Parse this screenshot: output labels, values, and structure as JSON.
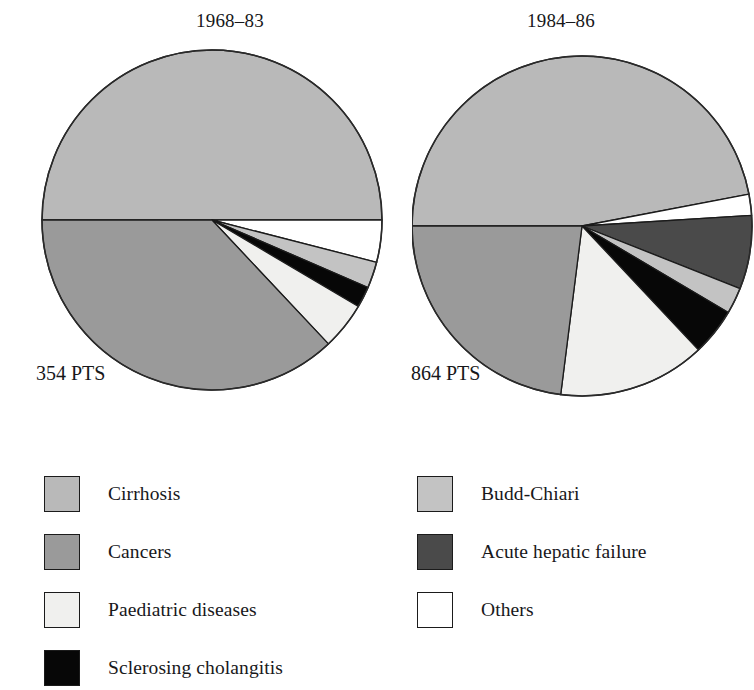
{
  "figure": {
    "pies": [
      {
        "title": "1968–83",
        "count_label": "354 PTS",
        "center": [
          172,
          172
        ],
        "radius": 170
      },
      {
        "title": "1984–86",
        "count_label": "864 PTS",
        "center": [
          170,
          178
        ],
        "radius": 170
      }
    ]
  },
  "legend": {
    "left": [
      {
        "label": "Cirrhosis",
        "color": "#b9b9b9",
        "key": "cirrhosis"
      },
      {
        "label": "Cancers",
        "color": "#9a9a9a",
        "key": "cancers"
      },
      {
        "label": "Paediatric diseases",
        "color": "#f0f0ee",
        "key": "paediatric-diseases"
      },
      {
        "label": "Sclerosing cholangitis",
        "color": "#070707",
        "key": "sclerosing-cholangitis"
      }
    ],
    "right": [
      {
        "label": "Budd-Chiari",
        "color": "#c3c3c3",
        "key": "budd-chiari"
      },
      {
        "label": "Acute hepatic failure",
        "color": "#4a4a4a",
        "key": "acute-hepatic-failure"
      },
      {
        "label": "Others",
        "color": "#ffffff",
        "key": "others"
      }
    ]
  },
  "chart_data": {
    "type": "pie",
    "units": "percent of patients",
    "legend_position": "bottom",
    "colors": {
      "Cirrhosis": "#b9b9b9",
      "Cancers": "#9a9a9a",
      "Paediatric diseases": "#f0f0ee",
      "Sclerosing cholangitis": "#070707",
      "Budd-Chiari": "#c3c3c3",
      "Acute hepatic failure": "#4a4a4a",
      "Others": "#ffffff"
    },
    "charts": [
      {
        "title": "1968–83",
        "total_label": "354 PTS",
        "total": 354,
        "start_angle_deg": 180,
        "direction": "clockwise",
        "categories": [
          "Cirrhosis",
          "Others",
          "Budd-Chiari",
          "Sclerosing cholangitis",
          "Paediatric diseases",
          "Cancers"
        ],
        "values": [
          50.0,
          4.0,
          2.5,
          2.0,
          4.5,
          37.0
        ]
      },
      {
        "title": "1984–86",
        "total_label": "864 PTS",
        "total": 864,
        "start_angle_deg": 180,
        "direction": "clockwise",
        "categories": [
          "Cirrhosis",
          "Others",
          "Acute hepatic failure",
          "Budd-Chiari",
          "Sclerosing cholangitis",
          "Paediatric diseases",
          "Cancers"
        ],
        "values": [
          47.0,
          2.0,
          7.0,
          2.5,
          4.5,
          14.0,
          23.0
        ]
      }
    ]
  }
}
